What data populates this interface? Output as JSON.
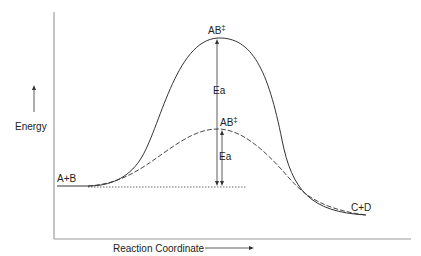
{
  "diagram": {
    "type": "energy-profile",
    "y_axis_label": "Energy",
    "x_axis_label": "Reaction Coordinate",
    "reactants_label": "A+B",
    "products_label": "C+D",
    "uncatalyzed": {
      "style": "solid",
      "transition_state_label": "AB",
      "transition_state_superscript": "‡",
      "activation_energy_label": "Ea"
    },
    "catalyzed": {
      "style": "dashed",
      "transition_state_label": "AB",
      "transition_state_superscript": "‡",
      "activation_energy_label": "Ea"
    },
    "colors": {
      "line": "#333333",
      "axis_x": "#9a9a9a",
      "axis_y": "#8a8a8a"
    }
  }
}
